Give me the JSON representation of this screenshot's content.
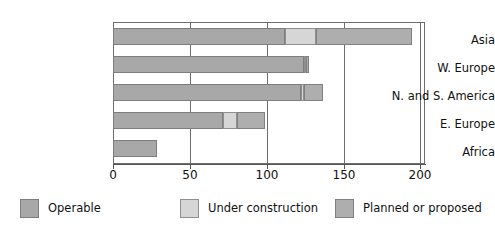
{
  "chart_data": {
    "type": "bar",
    "orientation": "horizontal",
    "stacked": true,
    "title": "",
    "xlabel": "",
    "ylabel": "",
    "xlim": [
      0,
      212
    ],
    "xticks": [
      0,
      50,
      100,
      150,
      200
    ],
    "xtick_labels": [
      "0",
      "50",
      "100",
      "150",
      "200"
    ],
    "grid": "vertical",
    "legend_position": "bottom",
    "categories": [
      "Asia",
      "W. Europe",
      "N. and S. America",
      "E. Europe",
      "Africa"
    ],
    "series": [
      {
        "name": "Operable",
        "color": "#a8a8a8",
        "values": [
          117,
          130,
          128,
          75,
          30
        ]
      },
      {
        "name": "Under construction",
        "color": "#d6d6d6",
        "values": [
          21,
          1,
          2,
          9,
          0
        ]
      },
      {
        "name": "Planned or proposed",
        "color": "#aeaeae",
        "values": [
          65,
          2,
          13,
          19,
          0
        ]
      }
    ],
    "totals": [
      203,
      133,
      143,
      103,
      30
    ]
  },
  "legend": {
    "items": [
      {
        "label": "Operable",
        "swatch": "operable"
      },
      {
        "label": "Under construction",
        "swatch": "construction"
      },
      {
        "label": "Planned or proposed",
        "swatch": "planned"
      }
    ]
  }
}
